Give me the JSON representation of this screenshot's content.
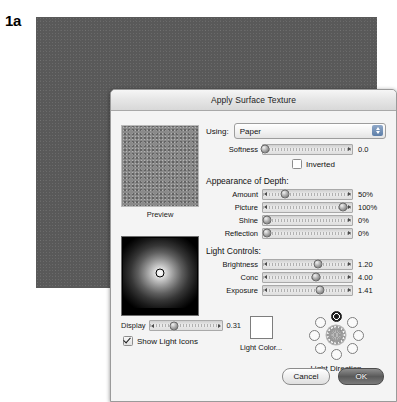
{
  "figure": {
    "label": "1a"
  },
  "dialog": {
    "title": "Apply Surface Texture",
    "using": {
      "label": "Using:",
      "value": "Paper"
    },
    "softness": {
      "label": "Softness",
      "value": "0.0",
      "percent": 2
    },
    "inverted": {
      "label": "Inverted",
      "checked": false
    },
    "depth_group": {
      "title": "Appearance of Depth:"
    },
    "depth_sliders": [
      {
        "label": "Amount",
        "value": "50%",
        "percent": 25
      },
      {
        "label": "Picture",
        "value": "100%",
        "percent": 90
      },
      {
        "label": "Shine",
        "value": "0%",
        "percent": 4
      },
      {
        "label": "Reflection",
        "value": "0%",
        "percent": 4
      }
    ],
    "light_group": {
      "title": "Light Controls:"
    },
    "light_sliders": [
      {
        "label": "Brightness",
        "value": "1.20",
        "percent": 62
      },
      {
        "label": "Conc",
        "value": "4.00",
        "percent": 60
      },
      {
        "label": "Exposure",
        "value": "1.41",
        "percent": 64
      }
    ],
    "preview": {
      "caption": "Preview"
    },
    "display": {
      "label": "Display",
      "value": "0.31",
      "percent": 34
    },
    "show_light_icons": {
      "label": "Show Light Icons",
      "checked": true
    },
    "light_color": {
      "label": "Light Color..."
    },
    "light_direction": {
      "label": "Light Direction",
      "selected_index": 0,
      "dots": [
        {
          "name": "direction-n",
          "selected": true
        },
        {
          "name": "direction-ne",
          "selected": false
        },
        {
          "name": "direction-e",
          "selected": false
        },
        {
          "name": "direction-se",
          "selected": false
        },
        {
          "name": "direction-s",
          "selected": false
        },
        {
          "name": "direction-sw",
          "selected": false
        },
        {
          "name": "direction-w",
          "selected": false
        },
        {
          "name": "direction-nw",
          "selected": false
        }
      ]
    },
    "buttons": {
      "cancel": "Cancel",
      "ok": "OK"
    }
  },
  "colors": {
    "backdrop": "#595959",
    "dialog_bg": "#f4f4f4",
    "titlebar": "#e7e7e7",
    "stepper_blue": "#5d7ea8",
    "default_button": "#5a5a5a"
  }
}
